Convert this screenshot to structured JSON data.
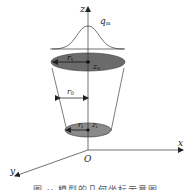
{
  "diagram": {
    "axes": {
      "z_label": "z",
      "x_label": "x",
      "y_label": "y",
      "origin_label": "O"
    },
    "heat_flux": {
      "label": "q",
      "subscript": "m",
      "shape": "gaussian"
    },
    "top_surface": {
      "radius_label": "r",
      "radius_subscript": "s",
      "height_label": "z",
      "height_subscript": "s",
      "fill_color": "#6b6b6b"
    },
    "middle": {
      "radius_label": "r",
      "radius_subscript": "0"
    },
    "bottom_surface": {
      "radius_label": "r",
      "radius_subscript": "i",
      "height_label": "z",
      "height_subscript": "i",
      "fill_color": "#8a8a8a"
    },
    "caption": "图 ·· 模型的几何坐标示意图"
  }
}
